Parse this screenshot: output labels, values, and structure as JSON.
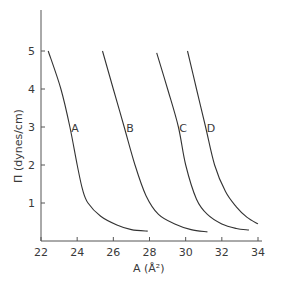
{
  "chart_data": {
    "type": "line",
    "title": "",
    "xlabel": "A (Å²)",
    "ylabel": "Π (dynes/cm)",
    "xlim": [
      22,
      34
    ],
    "ylim": [
      0,
      6
    ],
    "x_ticks": [
      "22",
      "24",
      "26",
      "28",
      "30",
      "32",
      "34"
    ],
    "y_ticks": [
      "1",
      "2",
      "3",
      "4",
      "5"
    ],
    "grid": false,
    "legend": "inline curve labels",
    "series": [
      {
        "name": "A",
        "points": [
          [
            22.4,
            5.0
          ],
          [
            23.1,
            4.0
          ],
          [
            23.6,
            3.0
          ],
          [
            24.0,
            2.0
          ],
          [
            24.3,
            1.35
          ],
          [
            24.6,
            1.0
          ],
          [
            25.3,
            0.65
          ],
          [
            26.2,
            0.42
          ],
          [
            27.0,
            0.3
          ],
          [
            27.9,
            0.26
          ]
        ]
      },
      {
        "name": "B",
        "points": [
          [
            25.4,
            5.0
          ],
          [
            26.0,
            4.0
          ],
          [
            26.6,
            3.0
          ],
          [
            27.2,
            2.0
          ],
          [
            27.8,
            1.2
          ],
          [
            28.5,
            0.7
          ],
          [
            29.4,
            0.45
          ],
          [
            30.3,
            0.3
          ],
          [
            31.2,
            0.24
          ]
        ]
      },
      {
        "name": "C",
        "points": [
          [
            28.4,
            4.95
          ],
          [
            29.0,
            4.0
          ],
          [
            29.6,
            3.0
          ],
          [
            30.0,
            2.0
          ],
          [
            30.6,
            1.1
          ],
          [
            31.2,
            0.7
          ],
          [
            32.0,
            0.45
          ],
          [
            32.8,
            0.33
          ],
          [
            33.5,
            0.29
          ]
        ]
      },
      {
        "name": "D",
        "points": [
          [
            30.1,
            5.0
          ],
          [
            30.6,
            4.0
          ],
          [
            31.1,
            3.0
          ],
          [
            31.6,
            2.0
          ],
          [
            32.2,
            1.3
          ],
          [
            32.8,
            0.9
          ],
          [
            33.4,
            0.62
          ],
          [
            34.0,
            0.45
          ]
        ]
      }
    ],
    "curve_label_positions": {
      "A": [
        75,
        128
      ],
      "B": [
        130,
        128
      ],
      "C": [
        183,
        128
      ],
      "D": [
        211,
        128
      ]
    }
  },
  "axes": {
    "x_title": "A (Å²)",
    "y_title": "Π (dynes/cm)"
  }
}
